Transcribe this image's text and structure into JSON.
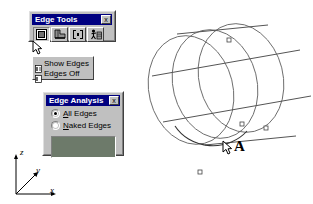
{
  "app": {
    "background": "#ffffff",
    "title_bar_color": "#000080",
    "chrome_color": "#c0c0c0"
  },
  "edge_tools": {
    "title": "Edge Tools",
    "close_label": "x",
    "buttons": [
      {
        "name": "show-edges-tool",
        "icon": "edges-display-icon",
        "pressed": true
      },
      {
        "name": "extract-edges-tool",
        "icon": "extract-edge-icon",
        "pressed": false
      },
      {
        "name": "split-edge-tool",
        "icon": "split-edge-icon",
        "pressed": false
      },
      {
        "name": "rebuild-edges-tool",
        "icon": "rebuild-edges-icon",
        "pressed": false
      }
    ]
  },
  "edge_menu": {
    "items": [
      {
        "label": "Show Edges",
        "icon": "menu-edge-icon"
      },
      {
        "label": "Edges Off",
        "icon": "menu-edge-off-icon"
      }
    ]
  },
  "edge_analysis": {
    "title": "Edge Analysis",
    "close_label": "x",
    "options": [
      {
        "label_pre": "",
        "label_accel": "A",
        "label_post": "ll Edges",
        "checked": true
      },
      {
        "label_pre": "",
        "label_accel": "N",
        "label_post": "aked Edges",
        "checked": false
      }
    ],
    "swatch_color": "#6d7a6a"
  },
  "viewport": {
    "annotation_label": "A",
    "geometry": "cylinder-wireframe",
    "edge_color": "#555555",
    "highlight_color": "#333333",
    "axis_triad": {
      "z": "z",
      "y": "y",
      "x": "x"
    }
  }
}
